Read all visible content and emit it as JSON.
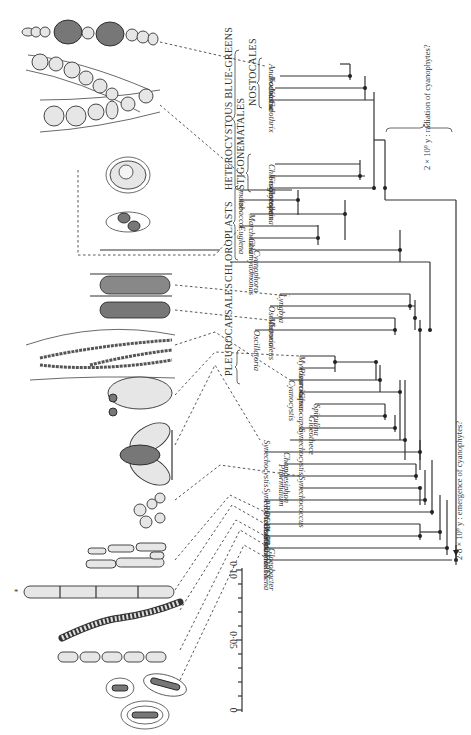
{
  "figure": {
    "orientation": "rotated 90° (leaves point left, root at right)"
  },
  "axis": {
    "label_ticks": [
      "0·10",
      "0·05",
      "0"
    ],
    "minor_ticks": 10
  },
  "annotations": {
    "emergence": "2·8 × 10⁹ y : emergence of cyanophytes?",
    "radiation": "2 × 10⁹ y : radiation of cyanophytes?"
  },
  "groups": {
    "heterocystous": "HETEROCYSTOUS BLUE-GREENS",
    "stigonematales": "STIGONEMATALES",
    "nostocales": "NOSTOCALES",
    "chloroplasts": "CHLOROPLASTS",
    "pleurocapsales": "PLEUROCAPSALES"
  },
  "taxa": [
    "Anabaena",
    "Nodularia",
    "Nostoc",
    "Calothrix",
    "Chlorogloeopsis",
    "Fischerella",
    "Scytonema",
    "maize",
    "tobacco",
    "Marchantia",
    "Euglena",
    "Chlamydomonas",
    "Cyanophora",
    "Lyngbya",
    "Oscillatoria",
    "Microcoleus",
    "Oscillatoria",
    "Myxosarcina",
    "Pleurocapsa",
    "Cyanocystis",
    "Gloeocapsa",
    "Spirulina",
    "Gloeothece",
    "Synechocystis",
    "Synechocystis",
    "Chamaesiphon",
    "Phormidium",
    "Synechococcus",
    "Synechococcus",
    "PROCHLOROTHRIX",
    "Plectonema",
    "Oscillatoria",
    "Pseudanabaena",
    "Gloeobacter"
  ]
}
